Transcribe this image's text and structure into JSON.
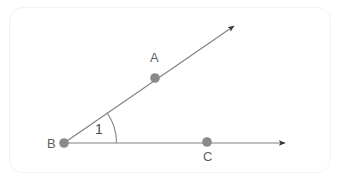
{
  "figure": {
    "background_color": "#ffffff",
    "card_border_color": "#f2f2f2",
    "stroke_color": "#808080",
    "point_color": "#8a8a8a",
    "arrow_color": "#333333",
    "label_color": "#5f5f5f",
    "points": [
      {
        "name": "A",
        "label": "A",
        "x": 155,
        "y": 78,
        "label_x": 150,
        "label_y": 51
      },
      {
        "name": "B",
        "label": "B",
        "x": 64,
        "y": 143,
        "label_x": 47,
        "label_y": 137
      },
      {
        "name": "C",
        "label": "C",
        "x": 207,
        "y": 142,
        "label_x": 203,
        "label_y": 150
      }
    ],
    "rays": [
      {
        "name": "ray-BA",
        "from": "B",
        "x1": 64,
        "y1": 143,
        "x2": 239,
        "y2": 22,
        "arrow": "end"
      },
      {
        "name": "ray-BC",
        "from": "B",
        "x1": 64,
        "y1": 143,
        "x2": 290,
        "y2": 143,
        "arrow": "end"
      }
    ],
    "angle": {
      "name": "angle-1",
      "label": "1",
      "vertex": "B",
      "radius": 52,
      "label_x": 95,
      "label_y": 122
    }
  }
}
